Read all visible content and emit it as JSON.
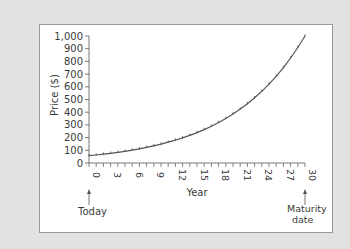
{
  "chart_data": {
    "type": "line",
    "title": "",
    "xlabel": "Year",
    "ylabel": "Price ($)",
    "xlim": [
      0,
      30
    ],
    "ylim": [
      0,
      1000
    ],
    "x_ticks": [
      0,
      3,
      6,
      9,
      12,
      15,
      18,
      21,
      24,
      27,
      30
    ],
    "y_ticks": [
      0,
      100,
      200,
      300,
      400,
      500,
      600,
      700,
      800,
      900,
      1000
    ],
    "y_tick_labels": [
      "0",
      "100",
      "200",
      "300",
      "400",
      "500",
      "600",
      "700",
      "800",
      "900",
      "1,000"
    ],
    "grid": false,
    "legend": null,
    "series": [
      {
        "name": "Zero-coupon bond price",
        "x": [
          0,
          1,
          2,
          3,
          4,
          5,
          6,
          7,
          8,
          9,
          10,
          11,
          12,
          13,
          14,
          15,
          16,
          17,
          18,
          19,
          20,
          21,
          22,
          23,
          24,
          25,
          26,
          27,
          28,
          29,
          30
        ],
        "values": [
          57.3,
          63.0,
          69.3,
          76.2,
          83.8,
          92.2,
          101.5,
          111.6,
          122.8,
          135.1,
          148.6,
          163.5,
          179.9,
          197.8,
          217.6,
          239.4,
          263.3,
          289.7,
          318.6,
          350.5,
          385.5,
          424.1,
          466.5,
          513.2,
          564.5,
          620.9,
          683.0,
          751.3,
          826.4,
          909.1,
          1000
        ]
      }
    ],
    "annotations": [
      {
        "x": 0,
        "text": "Today",
        "arrow": "up"
      },
      {
        "x": 30,
        "text": "Maturity\ndate",
        "arrow": "up"
      }
    ]
  },
  "labels": {
    "ylabel": "Price ($)",
    "xlabel": "Year",
    "today": "Today",
    "maturity_line1": "Maturity",
    "maturity_line2": "date"
  },
  "colors": {
    "background": "#e2e2e2",
    "panel": "#ffffff",
    "axis": "#555555",
    "curve": "#555555",
    "text": "#3a3a3a"
  }
}
